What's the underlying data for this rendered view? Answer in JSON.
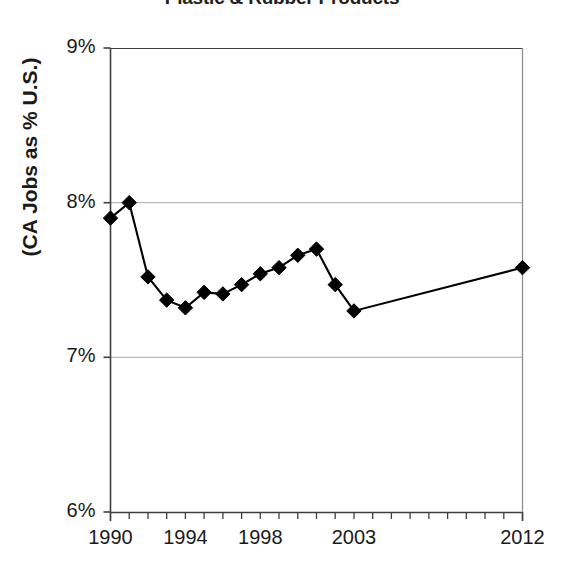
{
  "chart_data": {
    "type": "line",
    "title": "Plastic & Rubber Products",
    "subtitle": "",
    "xlabel": "",
    "ylabel": "(CA Jobs as % U.S.)",
    "ylim": [
      6,
      9
    ],
    "xlim": [
      1990,
      2012
    ],
    "ytick_labels": [
      "9%",
      "8%",
      "7%",
      "6%"
    ],
    "ytick_values": [
      9,
      8,
      7,
      6
    ],
    "xtick_labels": [
      "1990",
      "1994",
      "1998",
      "2003",
      "2012"
    ],
    "xtick_values": [
      1990,
      1994,
      1998,
      2003,
      2012
    ],
    "xtick_minor_interval": 1,
    "grid": "horizontal",
    "legend_position": "none",
    "marker": "diamond",
    "marker_color": "#000000",
    "line_color": "#000000",
    "axis_color": "#3f3f3f",
    "grid_color": "#a6a6a6",
    "series": [
      {
        "name": "CA Jobs as % U.S.",
        "x": [
          1990,
          1991,
          1992,
          1993,
          1994,
          1995,
          1996,
          1997,
          1998,
          1999,
          2000,
          2001,
          2002,
          2003,
          2012
        ],
        "values": [
          7.9,
          8.0,
          7.52,
          7.37,
          7.32,
          7.42,
          7.41,
          7.47,
          7.54,
          7.58,
          7.66,
          7.7,
          7.47,
          7.3,
          7.58
        ]
      }
    ]
  }
}
